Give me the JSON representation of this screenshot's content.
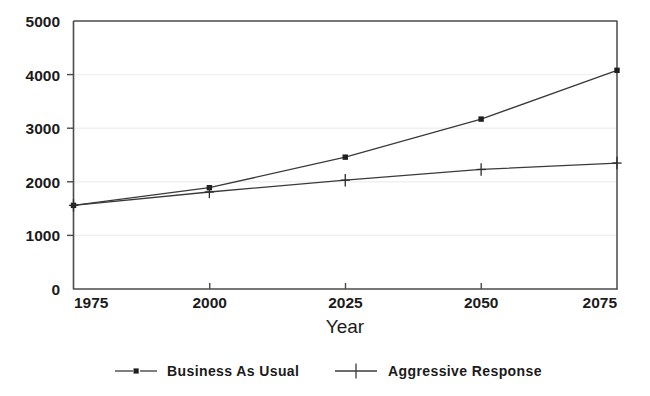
{
  "chart_data": {
    "type": "line",
    "title": "",
    "subtitle": "",
    "xlabel": "Year",
    "ylabel": "",
    "x": [
      1975,
      2000,
      2025,
      2050,
      2075
    ],
    "xtick_labels": [
      "1975",
      "2000",
      "2025",
      "2050",
      "2075"
    ],
    "ytick_labels": [
      "0",
      "1000",
      "2000",
      "3000",
      "4000",
      "5000"
    ],
    "ytick_values": [
      0,
      1000,
      2000,
      3000,
      4000,
      5000
    ],
    "xlim": [
      1975,
      2075
    ],
    "ylim": [
      0,
      5000
    ],
    "grid": "horizontal-faint",
    "legend_position": "bottom-outside",
    "series": [
      {
        "name": "Business As Usual",
        "marker": "square-dot",
        "values": [
          1560,
          1890,
          2460,
          3170,
          4080
        ]
      },
      {
        "name": "Aggressive Response",
        "marker": "plus",
        "values": [
          1560,
          1810,
          2030,
          2230,
          2350
        ]
      }
    ]
  },
  "axis": {
    "y_labels": [
      {
        "text": "5000",
        "value": 5000
      },
      {
        "text": "4000",
        "value": 4000
      },
      {
        "text": "3000",
        "value": 3000
      },
      {
        "text": "2000",
        "value": 2000
      },
      {
        "text": "1000",
        "value": 1000
      },
      {
        "text": "0",
        "value": 0
      }
    ],
    "x_labels": [
      {
        "text": "1975",
        "value": 1975
      },
      {
        "text": "2000",
        "value": 2000
      },
      {
        "text": "2025",
        "value": 2025
      },
      {
        "text": "2050",
        "value": 2050
      },
      {
        "text": "2075",
        "value": 2075
      }
    ],
    "x_title": "Year"
  },
  "legend": {
    "entries": [
      {
        "label": "Business As Usual",
        "marker": "square-dot-icon"
      },
      {
        "label": "Aggressive Response",
        "marker": "plus-marker-icon"
      }
    ]
  },
  "colors": {
    "line": "#3a3a3a",
    "axis": "#4a4a4a",
    "grid": "#f0eeee",
    "text": "#1b1b1b",
    "background": "#ffffff"
  }
}
